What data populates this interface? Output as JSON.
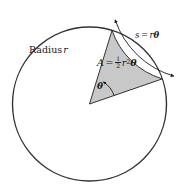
{
  "figure": {
    "background_color": "#ffffff"
  },
  "circle": {
    "stroke_color": "#333333",
    "fill_color": "#ffffff",
    "center_x": 89.5,
    "center_y": 104,
    "radius": 77,
    "stroke_width": 1.4
  },
  "sector": {
    "fill_color": "#c8c8c8",
    "stroke_color": "#333333",
    "stroke_width": 1.0,
    "start_angle_deg": 19,
    "end_angle_deg": 73,
    "apex_x": 89.5,
    "apex_y": 104
  },
  "angle_arc": {
    "stroke_color": "#1a1a1a",
    "radius": 26,
    "start_angle_deg": 19,
    "end_angle_deg": 58
  },
  "arc_measure": {
    "stroke_color": "#1a1a1a",
    "offset": 11,
    "start_angle_deg": 19,
    "end_angle_deg": 73,
    "arrowheads": "both"
  },
  "labels": {
    "radius": {
      "text": "Radius",
      "variable": "r"
    },
    "area": {
      "lhs": "A",
      "equals": "=",
      "numerator": "1",
      "denominator": "2",
      "variable": "r",
      "exponent": "2",
      "angle": "θ"
    },
    "arc_length": {
      "lhs": "s",
      "equals": "=",
      "radius_var": "r",
      "angle": "θ"
    },
    "theta": {
      "symbol": "θ"
    }
  }
}
